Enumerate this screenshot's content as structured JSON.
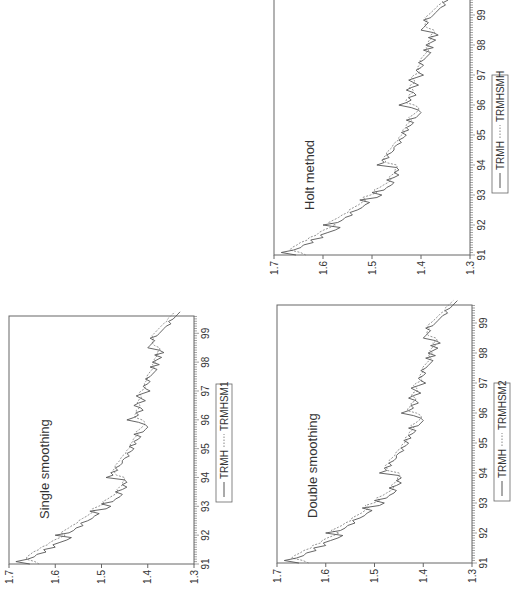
{
  "chart_data": [
    {
      "type": "line",
      "title": "Single smoothing",
      "xlabel": "",
      "ylabel": "",
      "x_ticks": [
        "91",
        "92",
        "93",
        "94",
        "95",
        "96",
        "97",
        "98",
        "99"
      ],
      "y_ticks": [
        "1.3",
        "1.4",
        "1.5",
        "1.6",
        "1.7"
      ],
      "ylim": [
        1.3,
        1.7
      ],
      "xlim": [
        1991,
        1999.6
      ],
      "grid": false,
      "legend_position": "bottom",
      "orientation": "rotated 90° counter-clockwise",
      "series": [
        {
          "name": "TRMH",
          "style": "solid"
        },
        {
          "name": "TRMHSM1",
          "style": "dotted"
        }
      ]
    },
    {
      "type": "line",
      "title": "Double smoothing",
      "xlabel": "",
      "ylabel": "",
      "x_ticks": [
        "91",
        "92",
        "93",
        "94",
        "95",
        "96",
        "97",
        "98",
        "99"
      ],
      "y_ticks": [
        "1.3",
        "1.4",
        "1.5",
        "1.6",
        "1.7"
      ],
      "ylim": [
        1.3,
        1.7
      ],
      "xlim": [
        1991,
        1999.6
      ],
      "grid": false,
      "legend_position": "bottom",
      "orientation": "rotated 90° counter-clockwise",
      "series": [
        {
          "name": "TRMH",
          "style": "solid"
        },
        {
          "name": "TRMHSM2",
          "style": "dotted"
        }
      ]
    },
    {
      "type": "line",
      "title": "Holt method",
      "xlabel": "",
      "ylabel": "",
      "x_ticks": [
        "91",
        "92",
        "93",
        "94",
        "95",
        "96",
        "97",
        "98",
        "99"
      ],
      "y_ticks": [
        "1.3",
        "1.4",
        "1.5",
        "1.6",
        "1.7"
      ],
      "ylim": [
        1.3,
        1.7
      ],
      "xlim": [
        1991,
        1999.6
      ],
      "grid": false,
      "legend_position": "bottom",
      "orientation": "rotated 90° counter-clockwise",
      "series": [
        {
          "name": "TRMH",
          "style": "solid"
        },
        {
          "name": "TRMHSMH",
          "style": "dotted"
        }
      ]
    }
  ],
  "series_values": {
    "x_start": 1991.0,
    "x_step": 0.0833,
    "TRMH": [
      1.655,
      1.685,
      1.66,
      1.645,
      1.64,
      1.62,
      1.625,
      1.6,
      1.605,
      1.59,
      1.575,
      1.565,
      1.6,
      1.57,
      1.56,
      1.555,
      1.54,
      1.545,
      1.53,
      1.52,
      1.515,
      1.505,
      1.525,
      1.49,
      1.48,
      1.5,
      1.475,
      1.47,
      1.46,
      1.455,
      1.47,
      1.455,
      1.445,
      1.455,
      1.445,
      1.45,
      1.49,
      1.475,
      1.48,
      1.465,
      1.47,
      1.46,
      1.455,
      1.455,
      1.45,
      1.44,
      1.445,
      1.435,
      1.43,
      1.44,
      1.425,
      1.43,
      1.42,
      1.415,
      1.43,
      1.41,
      1.405,
      1.4,
      1.405,
      1.42,
      1.445,
      1.43,
      1.42,
      1.425,
      1.41,
      1.415,
      1.43,
      1.42,
      1.405,
      1.415,
      1.425,
      1.41,
      1.395,
      1.405,
      1.41,
      1.4,
      1.395,
      1.405,
      1.395,
      1.39,
      1.385,
      1.38,
      1.395,
      1.375,
      1.39,
      1.38,
      1.37,
      1.385,
      1.365,
      1.375,
      1.4,
      1.395,
      1.39,
      1.385,
      1.395,
      1.38,
      1.375,
      1.37,
      1.365,
      1.36,
      1.35,
      1.355,
      1.345,
      1.34,
      1.335,
      1.33
    ],
    "dx_px": 2.3
  },
  "legends": [
    {
      "solid": "TRMH",
      "dotted": "TRMHSM1"
    },
    {
      "solid": "TRMH",
      "dotted": "TRMHSM2"
    },
    {
      "solid": "TRMH",
      "dotted": "TRMHSMH"
    }
  ],
  "colors": {
    "solid": "#555555",
    "dotted": "#888888",
    "frame": "#666666",
    "text": "#333333"
  }
}
